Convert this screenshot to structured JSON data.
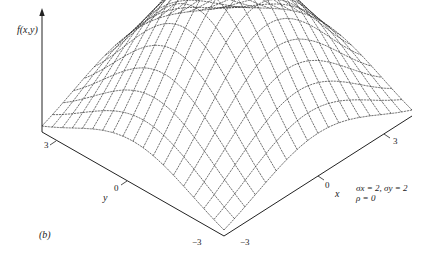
{
  "figure": {
    "panel_label": "(b)",
    "z_axis_label": "f(x,y)",
    "x_axis_label": "x",
    "y_axis_label": "y",
    "x_ticks": [
      "−3",
      "0",
      "3"
    ],
    "y_ticks": [
      "3",
      "0",
      "−3"
    ],
    "params": {
      "line1": "σx = 2, σy = 2",
      "line2": "ρ  = 0"
    }
  },
  "chart_data": {
    "type": "surface-wireframe",
    "title": "",
    "function": "bivariate normal density f(x,y)",
    "sigma_x": 2,
    "sigma_y": 2,
    "rho": 0,
    "x_range": [
      -3,
      3
    ],
    "y_range": [
      -3,
      3
    ],
    "x_ticks": [
      -3,
      0,
      3
    ],
    "y_ticks": [
      -3,
      0,
      3
    ],
    "xlabel": "x",
    "ylabel": "y",
    "zlabel": "f(x,y)",
    "grid_lines_per_axis": 19,
    "panel": "(b)"
  },
  "colors": {
    "ink": "#222222",
    "mesh": "#333333",
    "background": "#ffffff"
  }
}
